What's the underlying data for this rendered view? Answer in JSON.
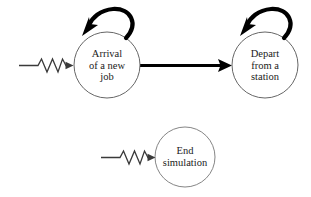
{
  "diagram": {
    "type": "state-event-transition-diagram",
    "background_color": "#ffffff",
    "stroke_color": "#1a1a1a",
    "thick_stroke_color": "#000000",
    "nodes": [
      {
        "id": "arrival",
        "name": "arrival-of-a-new-job-node",
        "shape": "circle",
        "center_x": 107,
        "center_y": 65,
        "radius": 33,
        "lines": [
          "Arrival",
          "of a new",
          "job"
        ],
        "has_self_loop": true,
        "has_incoming_random_arrow": true
      },
      {
        "id": "depart",
        "name": "depart-from-a-station-node",
        "shape": "circle",
        "center_x": 265,
        "center_y": 65,
        "radius": 33,
        "lines": [
          "Depart",
          "from a",
          "station"
        ],
        "has_self_loop": true,
        "has_incoming_random_arrow": false
      },
      {
        "id": "end",
        "name": "end-simulation-node",
        "shape": "circle",
        "center_x": 185,
        "center_y": 157,
        "radius": 30,
        "lines": [
          "End",
          "simulation"
        ],
        "has_self_loop": false,
        "has_incoming_random_arrow": true
      }
    ],
    "edges": [
      {
        "id": "arrival-to-depart",
        "name": "arrival-to-depart-arrow",
        "style": "thick-straight-arrow",
        "from": "arrival",
        "to": "depart"
      },
      {
        "id": "arrival-self-loop",
        "name": "arrival-self-loop-arrow",
        "style": "thick-curved-self-loop",
        "from": "arrival",
        "to": "arrival"
      },
      {
        "id": "depart-self-loop",
        "name": "depart-self-loop-arrow",
        "style": "thick-curved-self-loop",
        "from": "depart",
        "to": "depart"
      },
      {
        "id": "external-to-arrival",
        "name": "random-delay-arrow-to-arrival",
        "style": "zigzag-random-delay-arrow",
        "from": "external",
        "to": "arrival"
      },
      {
        "id": "external-to-end",
        "name": "random-delay-arrow-to-end-simulation",
        "style": "zigzag-random-delay-arrow",
        "from": "external",
        "to": "end"
      }
    ]
  }
}
